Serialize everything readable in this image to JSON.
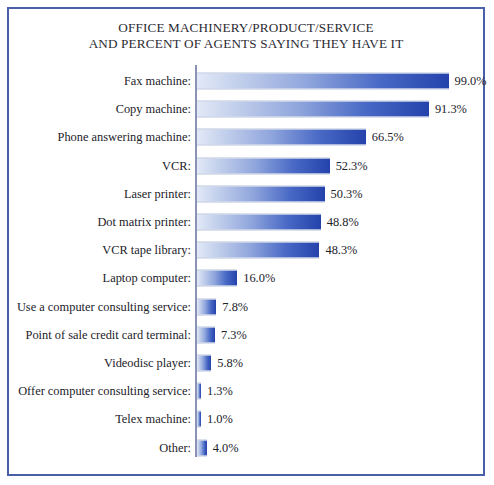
{
  "chart_data": {
    "type": "bar",
    "orientation": "horizontal",
    "title": "OFFICE MACHINERY/PRODUCT/SERVICE AND PERCENT OF AGENTS SAYING THEY HAVE IT",
    "title_lines": [
      "OFFICE MACHINERY/PRODUCT/SERVICE",
      "AND PERCENT OF AGENTS SAYING THEY HAVE IT"
    ],
    "xlabel": "",
    "ylabel": "",
    "xlim": [
      0,
      99
    ],
    "grid": false,
    "legend": "none",
    "value_suffix": "%",
    "categories": [
      "Fax machine:",
      "Copy machine:",
      "Phone answering machine:",
      "VCR:",
      "Laser printer:",
      "Dot matrix printer:",
      "VCR tape library:",
      "Laptop computer:",
      "Use a computer consulting service:",
      "Point of sale credit card terminal:",
      "Videodisc player:",
      "Offer computer consulting service:",
      "Telex machine:",
      "Other:"
    ],
    "values": [
      99.0,
      91.3,
      66.5,
      52.3,
      50.3,
      48.8,
      48.3,
      16.0,
      7.8,
      7.3,
      5.8,
      1.3,
      1.0,
      4.0
    ],
    "value_labels": [
      "99.0%",
      "91.3%",
      "66.5%",
      "52.3%",
      "50.3%",
      "48.8%",
      "48.3%",
      "16.0%",
      "7.8%",
      "7.3%",
      "5.8%",
      "1.3%",
      "1.0%",
      "4.0%"
    ],
    "bars": [
      {
        "label": "Fax machine:",
        "value": 99.0,
        "value_label": "99.0%"
      },
      {
        "label": "Copy machine:",
        "value": 91.3,
        "value_label": "91.3%"
      },
      {
        "label": "Phone answering machine:",
        "value": 66.5,
        "value_label": "66.5%"
      },
      {
        "label": "VCR:",
        "value": 52.3,
        "value_label": "52.3%"
      },
      {
        "label": "Laser printer:",
        "value": 50.3,
        "value_label": "50.3%"
      },
      {
        "label": "Dot matrix printer:",
        "value": 48.8,
        "value_label": "48.8%"
      },
      {
        "label": "VCR tape library:",
        "value": 48.3,
        "value_label": "48.3%"
      },
      {
        "label": "Laptop computer:",
        "value": 16.0,
        "value_label": "16.0%"
      },
      {
        "label": "Use a computer consulting service:",
        "value": 7.8,
        "value_label": "7.8%"
      },
      {
        "label": "Point of sale credit card terminal:",
        "value": 7.3,
        "value_label": "7.3%"
      },
      {
        "label": "Videodisc player:",
        "value": 5.8,
        "value_label": "5.8%"
      },
      {
        "label": "Offer computer consulting service:",
        "value": 1.3,
        "value_label": "1.3%"
      },
      {
        "label": "Telex machine:",
        "value": 1.0,
        "value_label": "1.0%"
      },
      {
        "label": "Other:",
        "value": 4.0,
        "value_label": "4.0%"
      }
    ],
    "colors": {
      "bar_gradient_start": "#e2e9f7",
      "bar_gradient_end": "#2442ab",
      "frame_border": "#4a5fa8",
      "axis_line": "#8a93b5",
      "text": "#22222a",
      "background": "#ffffff"
    }
  }
}
